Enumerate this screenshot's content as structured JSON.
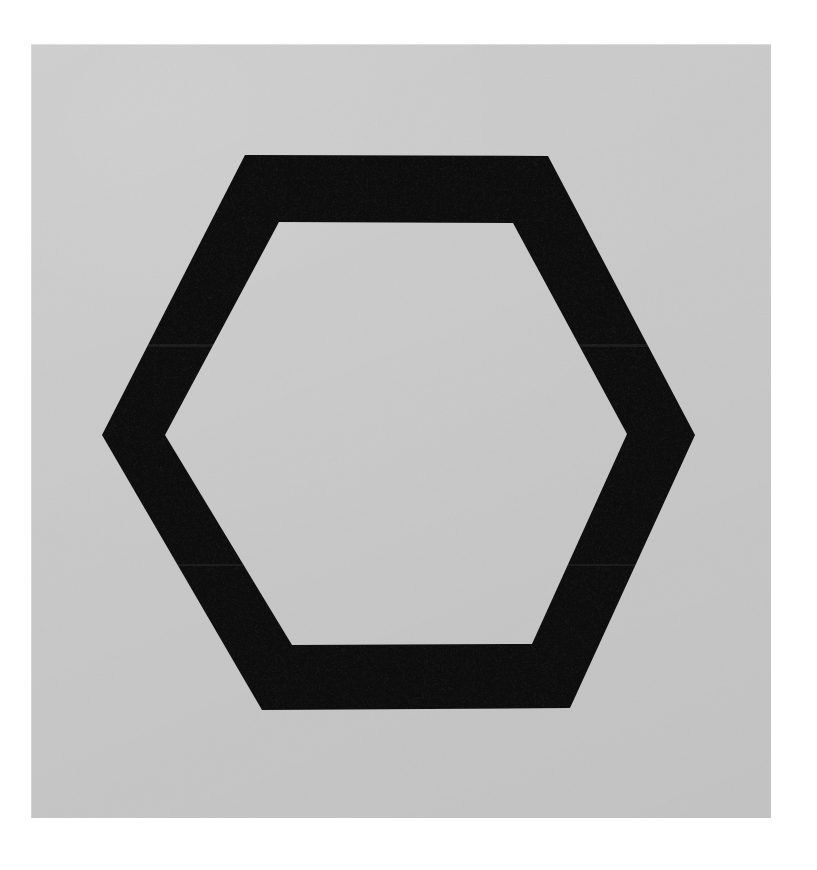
{
  "page": {
    "width": 817,
    "height": 870,
    "background_color": "#ffffff"
  },
  "paper": {
    "x": 31,
    "y": 44,
    "width": 740,
    "height": 774,
    "background_color": "#c9cac9",
    "description": "Photographed light gray card stock with even matte tone and fine grain"
  },
  "figure": {
    "name": "hexagon-outline",
    "shape": "hexagon",
    "orientation": "flat-top",
    "style": "hand-drawn thick outline ring, unfilled interior",
    "stroke_color": "#101010",
    "fill_color": "none",
    "interior_color": "#c9cac9",
    "stroke_width_px": 67,
    "edge_texture": "rough, grainy, slightly irregular brush / marker edges",
    "outer_vertices": [
      {
        "label": "top-left",
        "x": 245,
        "y": 155
      },
      {
        "label": "top-right",
        "x": 548,
        "y": 156
      },
      {
        "label": "right",
        "x": 695,
        "y": 435
      },
      {
        "label": "bottom-right",
        "x": 570,
        "y": 708
      },
      {
        "label": "bottom-left",
        "x": 262,
        "y": 710
      },
      {
        "label": "left",
        "x": 102,
        "y": 435
      }
    ],
    "inner_vertices": [
      {
        "label": "top-left",
        "x": 279,
        "y": 222
      },
      {
        "label": "top-right",
        "x": 513,
        "y": 223
      },
      {
        "label": "right",
        "x": 627,
        "y": 434
      },
      {
        "label": "bottom-right",
        "x": 532,
        "y": 644
      },
      {
        "label": "bottom-left",
        "x": 292,
        "y": 645
      },
      {
        "label": "left",
        "x": 165,
        "y": 435
      }
    ],
    "bounding_box": {
      "x": 102,
      "y": 155,
      "width": 593,
      "height": 555
    },
    "center": {
      "x": 398,
      "y": 432
    }
  },
  "colors": {
    "page_white": "#ffffff",
    "paper_gray": "#c9cac9",
    "paper_gray_light": "#cfd0cf",
    "paper_gray_dark": "#c3c4c3",
    "ink_black": "#101010",
    "ink_black_soft": "#1c1c1c"
  }
}
